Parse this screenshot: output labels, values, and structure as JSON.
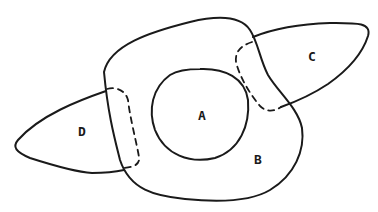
{
  "diagram": {
    "type": "set-diagram",
    "regions": [
      {
        "id": "A",
        "label": "A",
        "description": "inner circle"
      },
      {
        "id": "B",
        "label": "B",
        "description": "large enclosing blob"
      },
      {
        "id": "C",
        "label": "C",
        "description": "right lobe"
      },
      {
        "id": "D",
        "label": "D",
        "description": "left lobe"
      }
    ],
    "boundaries": [
      {
        "between": [
          "B",
          "C"
        ],
        "style": "dashed"
      },
      {
        "between": [
          "B",
          "D"
        ],
        "style": "dashed"
      }
    ],
    "colors": {
      "stroke": "#1a1a1a",
      "background": "#ffffff"
    }
  }
}
